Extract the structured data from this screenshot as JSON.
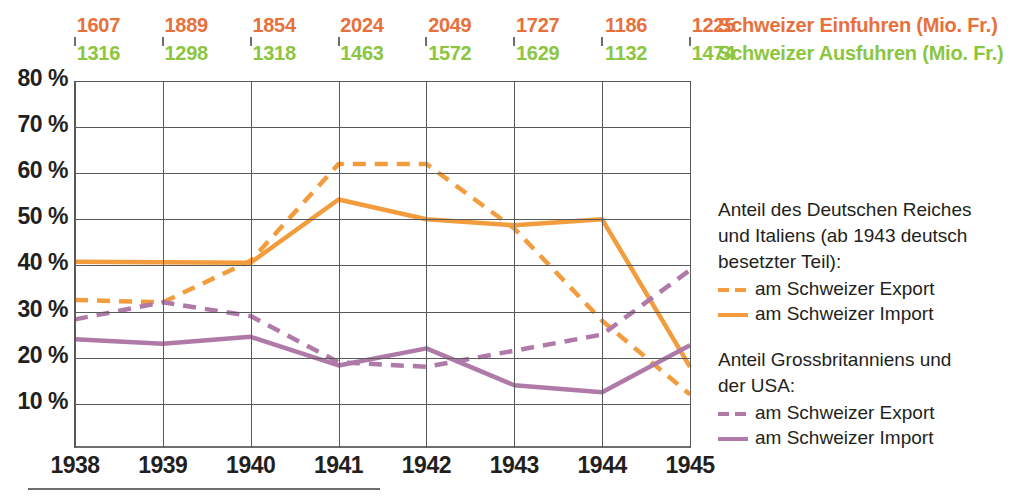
{
  "colors": {
    "import_value": "#e8703a",
    "export_value": "#8cc63f",
    "germany_line": "#f39c3d",
    "allies_line": "#b07aa8",
    "axis": "#58595b",
    "text": "#231f20"
  },
  "value_table": {
    "import_row_label": "Schweizer Einfuhren (Mio. Fr.)",
    "export_row_label": "Schweizer Ausfuhren (Mio. Fr.)",
    "imports": [
      1607,
      1889,
      1854,
      2024,
      2049,
      1727,
      1186,
      1225
    ],
    "exports": [
      1316,
      1298,
      1318,
      1463,
      1572,
      1629,
      1132,
      1474
    ]
  },
  "legend": {
    "group1_title_line1": "Anteil des Deutschen Reiches",
    "group1_title_line2": "und Italiens (ab 1943 deutsch",
    "group1_title_line3": "besetzter Teil):",
    "group1_export": "am Schweizer Export",
    "group1_import": "am Schweizer Import",
    "group2_title_line1": "Anteil Grossbritanniens und",
    "group2_title_line2": "der USA:",
    "group2_export": "am Schweizer Export",
    "group2_import": "am Schweizer Import"
  },
  "chart_data": {
    "type": "line",
    "title": "",
    "xlabel": "",
    "ylabel": "",
    "x": [
      1938,
      1939,
      1940,
      1941,
      1942,
      1943,
      1944,
      1945
    ],
    "xtick_labels": [
      "1938",
      "1939",
      "1940",
      "1941",
      "1942",
      "1943",
      "1944",
      "1945"
    ],
    "ytick_labels": [
      "80 %",
      "70 %",
      "60 %",
      "50 %",
      "40 %",
      "30 %",
      "20 %",
      "10 %"
    ],
    "ytick_values": [
      80,
      70,
      60,
      50,
      40,
      30,
      20,
      10
    ],
    "ylim": [
      5,
      80
    ],
    "yunit": "%",
    "grid": true,
    "legend_position": "right",
    "series": [
      {
        "name": "Anteil des Deutschen Reiches und Italiens am Schweizer Export",
        "style": "dashed",
        "color": "#f39c3d",
        "values": [
          32.5,
          32.0,
          41.0,
          62.0,
          62.0,
          48.0,
          28.0,
          12.0
        ]
      },
      {
        "name": "Anteil des Deutschen Reiches und Italiens am Schweizer Import",
        "style": "solid",
        "color": "#f39c3d",
        "values": [
          40.8,
          40.7,
          40.6,
          54.3,
          50.0,
          48.7,
          50.0,
          18.0
        ]
      },
      {
        "name": "Anteil Grossbritanniens und der USA am Schweizer Export",
        "style": "dashed",
        "color": "#b07aa8",
        "values": [
          28.3,
          32.0,
          29.0,
          19.0,
          18.0,
          21.5,
          25.0,
          39.0
        ]
      },
      {
        "name": "Anteil Grossbritanniens und der USA am Schweizer Import",
        "style": "solid",
        "color": "#b07aa8",
        "values": [
          24.0,
          23.0,
          24.5,
          18.3,
          22.0,
          14.0,
          12.5,
          22.7
        ]
      }
    ]
  }
}
